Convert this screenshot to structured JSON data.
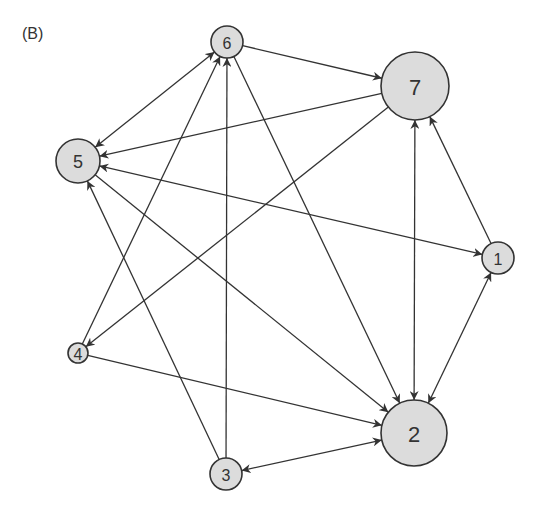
{
  "panel_label": "(B)",
  "colors": {
    "node_fill": "#dcdcdc",
    "stroke": "#333333"
  },
  "nodes": [
    {
      "id": "1",
      "x": 498,
      "y": 258,
      "r": 16
    },
    {
      "id": "2",
      "x": 414,
      "y": 433,
      "r": 33
    },
    {
      "id": "3",
      "x": 226,
      "y": 474,
      "r": 16
    },
    {
      "id": "4",
      "x": 78,
      "y": 353,
      "r": 10
    },
    {
      "id": "5",
      "x": 78,
      "y": 161,
      "r": 22
    },
    {
      "id": "6",
      "x": 227,
      "y": 42,
      "r": 16
    },
    {
      "id": "7",
      "x": 415,
      "y": 86,
      "r": 34
    }
  ],
  "edges": [
    {
      "from": "6",
      "to": "7",
      "bidirectional": false
    },
    {
      "from": "7",
      "to": "5",
      "bidirectional": false
    },
    {
      "from": "7",
      "to": "4",
      "bidirectional": false
    },
    {
      "from": "5",
      "to": "6",
      "bidirectional": true
    },
    {
      "from": "5",
      "to": "1",
      "bidirectional": true
    },
    {
      "from": "5",
      "to": "2",
      "bidirectional": false
    },
    {
      "from": "6",
      "to": "2",
      "bidirectional": false
    },
    {
      "from": "4",
      "to": "6",
      "bidirectional": false
    },
    {
      "from": "4",
      "to": "2",
      "bidirectional": false
    },
    {
      "from": "3",
      "to": "5",
      "bidirectional": false
    },
    {
      "from": "3",
      "to": "6",
      "bidirectional": false
    },
    {
      "from": "3",
      "to": "2",
      "bidirectional": true
    },
    {
      "from": "2",
      "to": "7",
      "bidirectional": true
    },
    {
      "from": "1",
      "to": "7",
      "bidirectional": false
    },
    {
      "from": "1",
      "to": "2",
      "bidirectional": true
    }
  ]
}
